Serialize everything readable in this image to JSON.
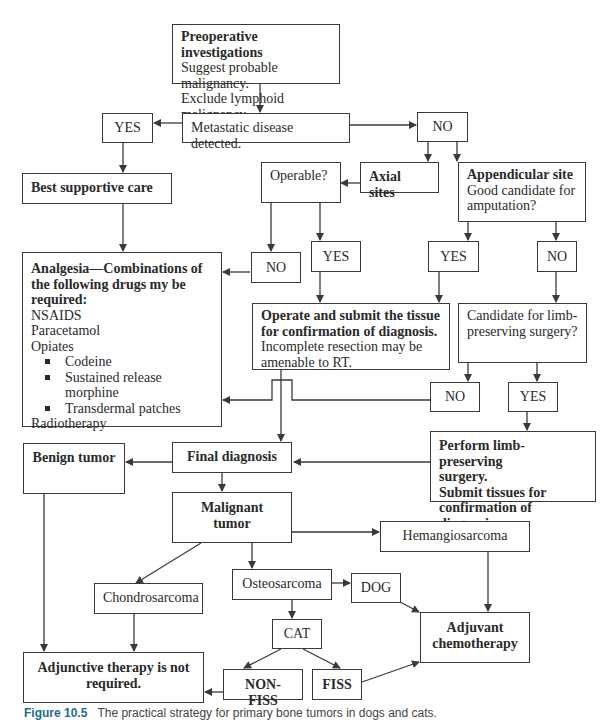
{
  "diagram": {
    "preop": {
      "title": "Preoperative investigations",
      "lines": [
        "Suggest probable malignancy.",
        "Exclude lymphoid malignancy."
      ]
    },
    "metastatic": "Metastatic disease detected.",
    "yes_meta": "YES",
    "no_meta": "NO",
    "best_supportive": "Best supportive care",
    "axial": "Axial sites",
    "operable": "Operable?",
    "appendicular": {
      "title": "Appendicular site",
      "lines": [
        "Good candidate for",
        "amputation?"
      ]
    },
    "operable_no": "NO",
    "operable_yes": "YES",
    "amputation_yes": "YES",
    "amputation_no": "NO",
    "analgesia": {
      "title_lines": [
        "Analgesia—Combinations of",
        "the following drugs my be",
        "required:"
      ],
      "items": [
        "NSAIDS",
        "Paracetamol",
        "Opiates"
      ],
      "opiates": [
        "Codeine",
        "Sustained release morphine",
        "Transdermal patches"
      ],
      "footer": "Radiotherapy"
    },
    "operate": {
      "title_lines": [
        "Operate and submit the tissue",
        "for confirmation of diagnosis."
      ],
      "lines": [
        "Incomplete resection may be",
        "amenable to RT."
      ]
    },
    "limb_candidate": {
      "lines": [
        "Candidate for limb-",
        "preserving surgery?"
      ]
    },
    "limb_no": "NO",
    "limb_yes": "YES",
    "limb_perform": {
      "lines": [
        "Perform limb-preserving",
        "surgery.",
        "Submit tissues for",
        "confirmation of diagnosis."
      ]
    },
    "benign": "Benign tumor",
    "final_diagnosis": "Final diagnosis",
    "malignant": "Malignant tumor",
    "hemangiosarcoma": "Hemangiosarcoma",
    "chondrosarcoma": "Chondrosarcoma",
    "osteosarcoma": "Osteosarcoma",
    "dog": "DOG",
    "cat": "CAT",
    "adjuvant": {
      "lines": [
        "Adjuvant",
        "chemotherapy"
      ]
    },
    "adjunctive": {
      "lines": [
        "Adjunctive therapy is not",
        "required."
      ]
    },
    "non_fiss": "NON-FISS",
    "fiss": "FISS"
  },
  "caption": {
    "figure": "Figure 10.5",
    "text": "The practical strategy for primary bone tumors in dogs and cats."
  },
  "colors": {
    "stroke": "#3a3a3a",
    "text": "#2a2a2a",
    "caption_accent": "#1e6a8a"
  }
}
